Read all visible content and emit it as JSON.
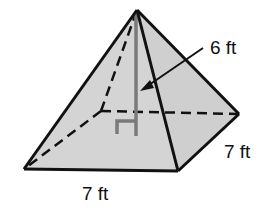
{
  "diagram": {
    "type": "square-pyramid",
    "labels": {
      "height": "6 ft",
      "base_front": "7 ft",
      "base_side": "7 ft"
    },
    "colors": {
      "face_fill": "#d4d4d4",
      "edge": "#111111",
      "height_line": "#7a7a7a",
      "background": "#ffffff"
    }
  }
}
